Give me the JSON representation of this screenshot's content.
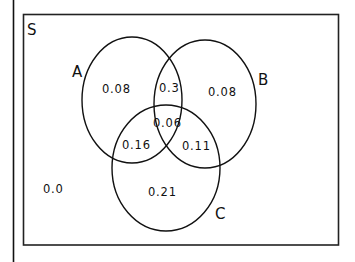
{
  "diagram": {
    "type": "venn",
    "universe_label": "S",
    "sets": [
      {
        "id": "A",
        "label": "A"
      },
      {
        "id": "B",
        "label": "B"
      },
      {
        "id": "C",
        "label": "C"
      }
    ],
    "regions": {
      "A_only": "0.08",
      "B_only": "0.08",
      "C_only": "0.21",
      "A_and_B_only": "0.3",
      "A_and_C_only": "0.16",
      "B_and_C_only": "0.11",
      "A_and_B_and_C": "0.06",
      "outside": "0.0"
    },
    "colors": {
      "stroke": "#111111",
      "background": "#ffffff"
    }
  }
}
